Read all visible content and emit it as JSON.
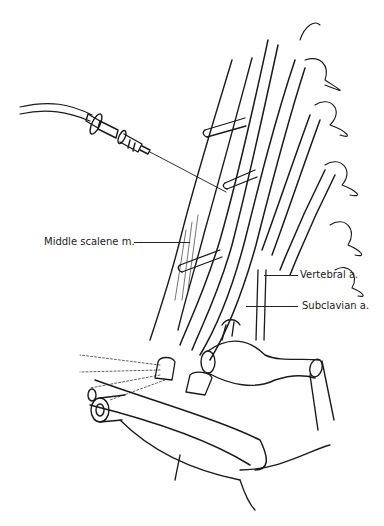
{
  "figure": {
    "colors": {
      "line": "#1a1a1a",
      "background": "#ffffff"
    },
    "labels": [
      {
        "id": "middle-scalene",
        "text": "Middle scalene m.",
        "x": 44,
        "y": 236,
        "leader": {
          "x1": 134,
          "x2": 190,
          "y": 242
        }
      },
      {
        "id": "vertebral",
        "text": "Vertebral a.",
        "x": 300,
        "y": 269,
        "leader": {
          "x1": 264,
          "x2": 298,
          "y": 275
        }
      },
      {
        "id": "subclavian",
        "text": "Subclavian a.",
        "x": 302,
        "y": 300,
        "leader": {
          "x1": 246,
          "x2": 298,
          "y": 306
        }
      }
    ]
  }
}
